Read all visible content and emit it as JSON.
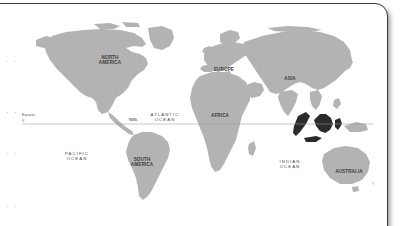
{
  "panel": {
    "background_color": "#ffffff",
    "border_color": "#3a3a3a"
  },
  "map": {
    "title": "World Map",
    "projection": "equirectangular",
    "land_color": "#b3b3b3",
    "ocean_color": "#ffffff",
    "highlight_color": "#2b2b2b",
    "highlight_region": "Indonesia",
    "equator": {
      "label": "Equator",
      "degree_label": "0°",
      "line_color": "#9a9a9a"
    },
    "continent_labels": [
      {
        "id": "north-america",
        "text": "NORTH\nAMERICA",
        "x": 88,
        "y": 46
      },
      {
        "id": "south-america",
        "text": "SOUTH\nAMERICA",
        "x": 120,
        "y": 148
      },
      {
        "id": "europe",
        "text": "EUROPE",
        "x": 202,
        "y": 56
      },
      {
        "id": "africa",
        "text": "AFRICA",
        "x": 198,
        "y": 102
      },
      {
        "id": "asia",
        "text": "ASIA",
        "x": 268,
        "y": 65
      },
      {
        "id": "australia",
        "text": "AUSTRALIA",
        "x": 327,
        "y": 158
      }
    ],
    "ocean_labels": [
      {
        "id": "pacific-ocean",
        "text": "PACIFIC\nOCEAN",
        "x": 55,
        "y": 142
      },
      {
        "id": "atlantic-ocean",
        "text": "ATLANTIC\nOCEAN",
        "x": 143,
        "y": 103
      },
      {
        "id": "indian-ocean",
        "text": "INDIAN\nOCEAN",
        "x": 268,
        "y": 150
      }
    ]
  },
  "margin_marks": [
    {
      "id": "mark-1",
      "y": 60
    },
    {
      "id": "mark-2",
      "y": 111
    },
    {
      "id": "mark-3",
      "y": 152
    },
    {
      "id": "mark-4",
      "y": 205
    }
  ]
}
